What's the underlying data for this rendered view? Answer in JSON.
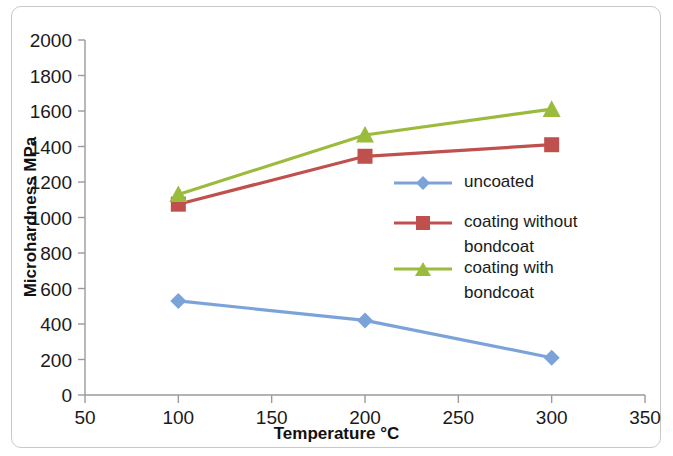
{
  "chart_data": {
    "type": "line",
    "title": "",
    "xlabel": "Temperature °C",
    "ylabel": "Microhardness MPa",
    "xlim": [
      50,
      350
    ],
    "ylim": [
      0,
      2000
    ],
    "xticks": [
      50,
      100,
      150,
      200,
      250,
      300,
      350
    ],
    "yticks": [
      0,
      200,
      400,
      600,
      800,
      1000,
      1200,
      1400,
      1600,
      1800,
      2000
    ],
    "xtick_labels": [
      "50",
      "100",
      "150",
      "200",
      "250",
      "300",
      "350"
    ],
    "ytick_labels": [
      "0",
      "200",
      "400",
      "600",
      "800",
      "1000",
      "1200",
      "1400",
      "1600",
      "1800",
      "2000"
    ],
    "grid": false,
    "legend_position": "center-right-inside",
    "x": [
      100,
      200,
      300
    ],
    "series": [
      {
        "name": "uncoated",
        "values": [
          530,
          420,
          210
        ],
        "color": "#7ba3da",
        "marker": "diamond"
      },
      {
        "name": "coating without bondcoat",
        "values": [
          1075,
          1345,
          1410
        ],
        "color": "#c0504d",
        "marker": "square"
      },
      {
        "name": "coating with bondcoat",
        "values": [
          1130,
          1465,
          1610
        ],
        "color": "#9bbb3c",
        "marker": "triangle"
      }
    ]
  },
  "legend": {
    "entries": [
      {
        "label": "uncoated",
        "label_line2": ""
      },
      {
        "label": "coating without",
        "label_line2": "bondcoat"
      },
      {
        "label": "coating with",
        "label_line2": "bondcoat"
      }
    ]
  },
  "axes": {
    "x_title": "Temperature °C",
    "y_title": "Microhardness MPa"
  }
}
